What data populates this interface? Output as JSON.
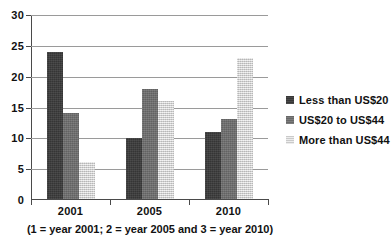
{
  "chart_data": {
    "type": "bar",
    "title": "",
    "subtitle": "",
    "xlabel": "(1 = year 2001; 2 = year 2005 and 3 = year 2010)",
    "ylabel": "",
    "categories": [
      "2001",
      "2005",
      "2010"
    ],
    "series": [
      {
        "name": "Less than US$20",
        "values": [
          24,
          10,
          11
        ],
        "color": "#3a3a3a"
      },
      {
        "name": "US$20 to US$44",
        "values": [
          14,
          18,
          13
        ],
        "color": "#6e6e6e"
      },
      {
        "name": "More than US$44",
        "values": [
          6,
          16,
          23
        ],
        "color": "#d9d9d9"
      }
    ],
    "ylim": [
      0,
      30
    ],
    "yticks": [
      0,
      5,
      10,
      15,
      20,
      25,
      30
    ],
    "ytick_labels": [
      "0",
      "5",
      "10",
      "15",
      "20",
      "25",
      "30"
    ],
    "grid": "horizontal",
    "legend_position": "right",
    "orientation": "vertical",
    "grouping": "grouped"
  },
  "axes": {
    "y_tick_labels": [
      "30",
      "25",
      "20",
      "15",
      "10",
      "5",
      "0"
    ],
    "x_tick_labels": [
      "2001",
      "2005",
      "2010"
    ],
    "caption": "(1 = year 2001; 2 = year 2005 and 3 = year 2010)"
  },
  "legend": {
    "items": [
      {
        "label": "Less than US$20",
        "swatch": "series-0-swatch"
      },
      {
        "label": "US$20 to US$44",
        "swatch": "series-1-swatch"
      },
      {
        "label": "More than US$44",
        "swatch": "series-2-swatch"
      }
    ]
  }
}
